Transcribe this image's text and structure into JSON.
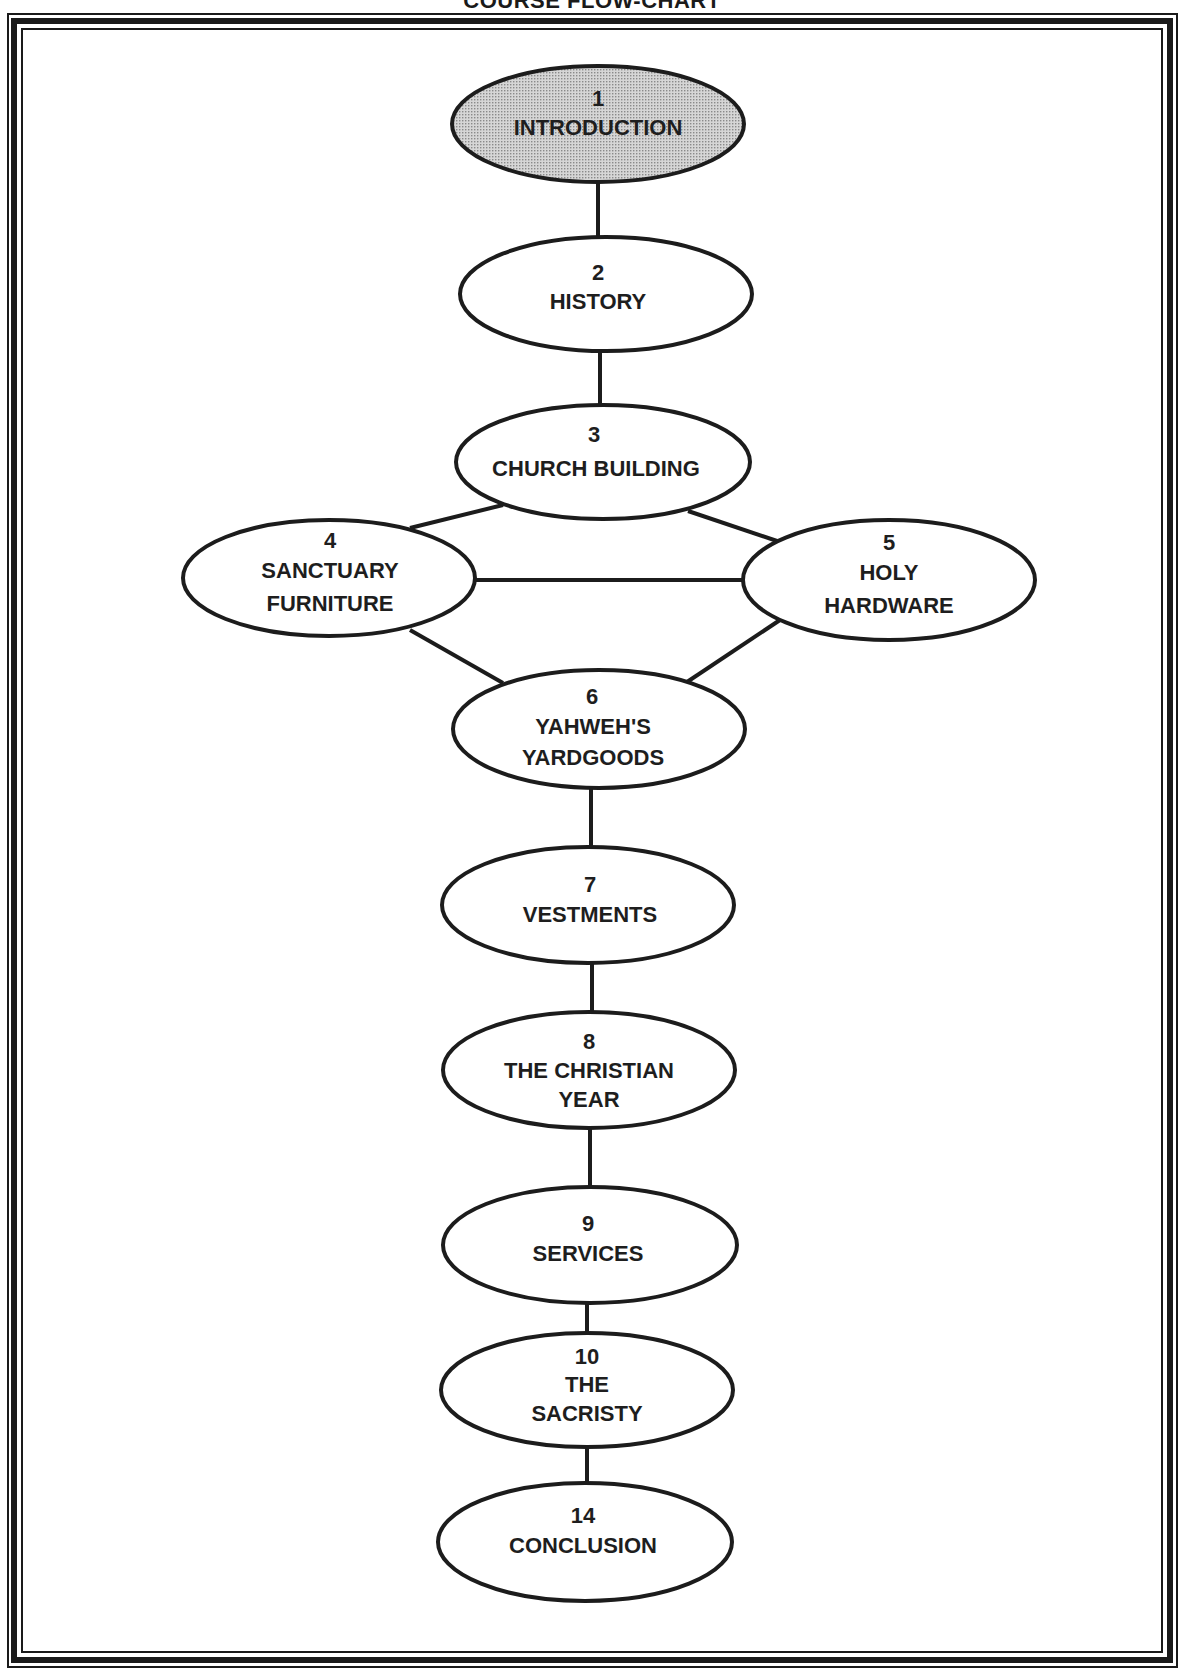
{
  "title": "COURSE FLOW-CHART",
  "colors": {
    "ink": "#1c1c1c",
    "highlight_fill": "#c9c9c9",
    "node_fill": "#ffffff"
  },
  "nodes": [
    {
      "id": "1",
      "number": "1",
      "lines": [
        "INTRODUCTION"
      ],
      "highlighted": true
    },
    {
      "id": "2",
      "number": "2",
      "lines": [
        "HISTORY"
      ]
    },
    {
      "id": "3",
      "number": "3",
      "lines": [
        "CHURCH BUILDING"
      ]
    },
    {
      "id": "4",
      "number": "4",
      "lines": [
        "SANCTUARY",
        "FURNITURE"
      ]
    },
    {
      "id": "5",
      "number": "5",
      "lines": [
        "HOLY",
        "HARDWARE"
      ]
    },
    {
      "id": "6",
      "number": "6",
      "lines": [
        "YAHWEH'S",
        "YARDGOODS"
      ]
    },
    {
      "id": "7",
      "number": "7",
      "lines": [
        "VESTMENTS"
      ]
    },
    {
      "id": "8",
      "number": "8",
      "lines": [
        "THE CHRISTIAN",
        "YEAR"
      ]
    },
    {
      "id": "9",
      "number": "9",
      "lines": [
        "SERVICES"
      ]
    },
    {
      "id": "10",
      "number": "10",
      "lines": [
        "THE",
        "SACRISTY"
      ]
    },
    {
      "id": "14",
      "number": "14",
      "lines": [
        "CONCLUSION"
      ]
    }
  ],
  "edges": [
    [
      "1",
      "2"
    ],
    [
      "2",
      "3"
    ],
    [
      "3",
      "4"
    ],
    [
      "3",
      "5"
    ],
    [
      "4",
      "5"
    ],
    [
      "4",
      "6"
    ],
    [
      "5",
      "6"
    ],
    [
      "6",
      "7"
    ],
    [
      "7",
      "8"
    ],
    [
      "8",
      "9"
    ],
    [
      "9",
      "10"
    ],
    [
      "10",
      "14"
    ]
  ]
}
